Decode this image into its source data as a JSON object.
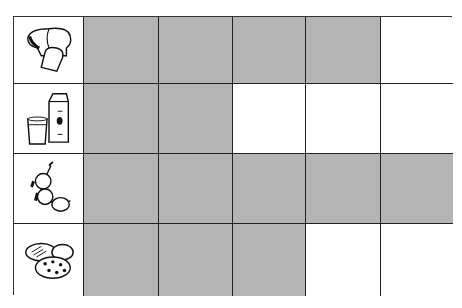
{
  "chart_data": {
    "type": "bar",
    "orientation": "horizontal",
    "title": "",
    "categories": [
      "bread",
      "milk",
      "fruit",
      "cookies"
    ],
    "values": [
      4,
      2,
      5,
      3
    ],
    "max_units": 5,
    "xlabel": "",
    "ylabel": "",
    "grid": true,
    "legend": null,
    "colors": {
      "shaded": "#b4b4b4",
      "empty": "#ffffff",
      "gridline": "#222222"
    }
  },
  "rows": [
    {
      "label": "bread",
      "icon": "bread-icon",
      "filled": 4
    },
    {
      "label": "milk",
      "icon": "milk-icon",
      "filled": 2
    },
    {
      "label": "fruit",
      "icon": "fruit-icon",
      "filled": 5
    },
    {
      "label": "cookies",
      "icon": "cookies-icon",
      "filled": 3
    }
  ]
}
